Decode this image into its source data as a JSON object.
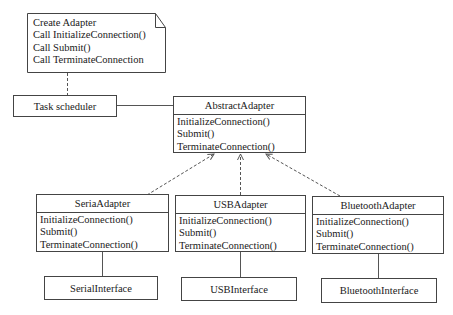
{
  "note": {
    "lines": [
      "Create Adapter",
      "Call InitializeConnection()",
      "Call Submit()",
      "Call TerminateConnection"
    ]
  },
  "task_scheduler": {
    "label": "Task scheduler"
  },
  "abstract_adapter": {
    "name": "AbstractAdapter",
    "methods": [
      "InitializeConnection()",
      "Submit()",
      "TerminateConnection()"
    ]
  },
  "adapters": [
    {
      "name": "SeriaAdapter",
      "methods": [
        "InitializeConnection()",
        "Submit()",
        "TerminateConnection()"
      ],
      "interface": "SerialInterface"
    },
    {
      "name": "USBAdapter",
      "methods": [
        "InitializeConnection()",
        "Submit()",
        "TerminateConnection()"
      ],
      "interface": "USBInterface"
    },
    {
      "name": "BluetoothAdapter",
      "methods": [
        "InitializeConnection()",
        "Submit()",
        "TerminateConnection()"
      ],
      "interface": "BluetoothInterface"
    }
  ]
}
